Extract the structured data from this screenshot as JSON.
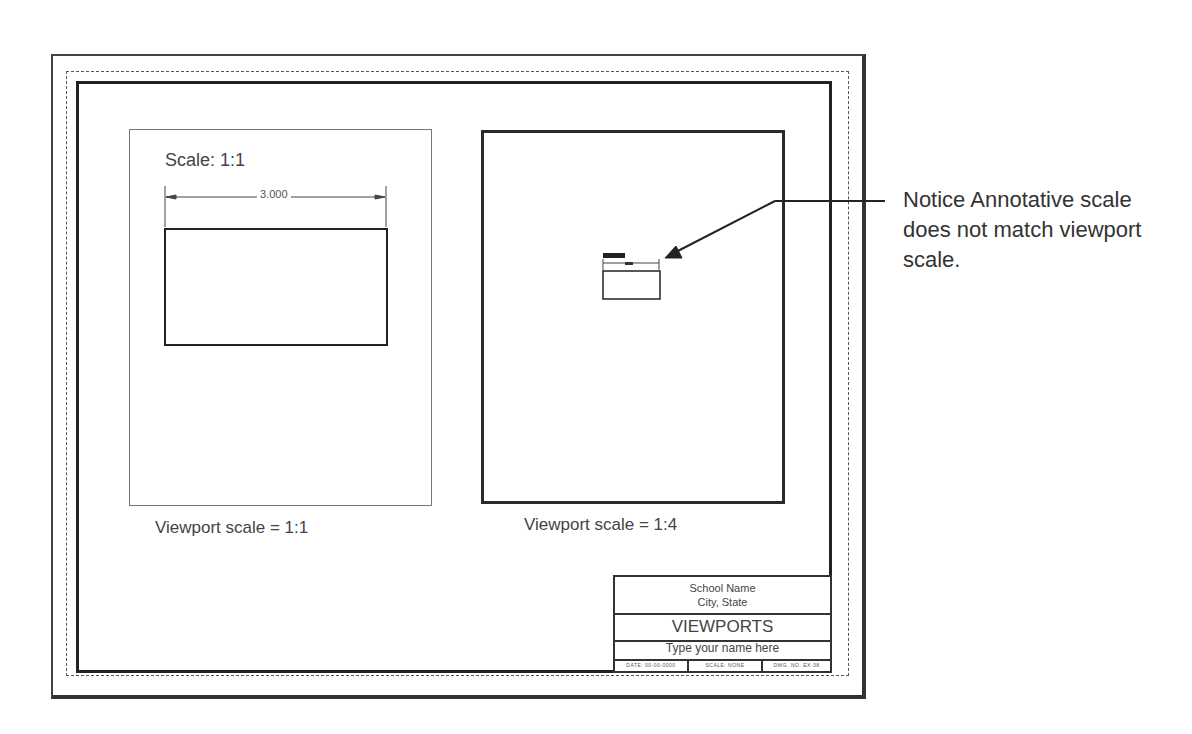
{
  "drawing": {
    "title": "VIEWPORTS",
    "left_viewport": {
      "annotation_label": "Scale: 1:1",
      "dimension_value": "3.000",
      "caption": "Viewport scale = 1:1"
    },
    "right_viewport": {
      "caption": "Viewport scale = 1:4"
    },
    "callout_note": "Notice Annotative scale does not match viewport scale."
  },
  "title_block": {
    "school_name": "School Name",
    "city_state": "City, State",
    "title": "VIEWPORTS",
    "name_placeholder": "Type your name here",
    "date": "DATE: 00-00-0000",
    "scale": "SCALE: NONE",
    "drawing_number": "DWG. NO. EX-38"
  },
  "colors": {
    "line": "#333333",
    "text": "#444444",
    "background": "#ffffff"
  }
}
